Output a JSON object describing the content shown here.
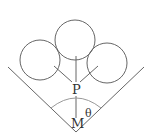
{
  "diagram": {
    "labels": {
      "point_p": "P",
      "point_m": "M",
      "angle": "θ"
    },
    "colors": {
      "stroke": "#666666",
      "arc": "#999999",
      "background": "#ffffff"
    }
  }
}
